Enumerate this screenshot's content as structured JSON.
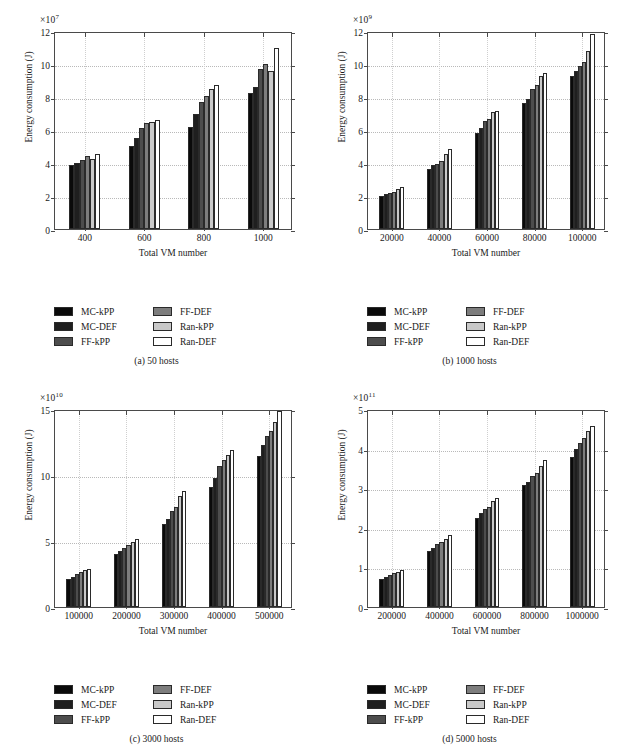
{
  "series_names": [
    "MC-kPP",
    "MC-DEF",
    "FF-kPP",
    "FF-DEF",
    "Ran-kPP",
    "Ran-DEF"
  ],
  "series_colors": [
    "#0a0a0a",
    "#1f1f1f",
    "#4d4d4d",
    "#7d7d7d",
    "#c9c9c9",
    "#ffffff"
  ],
  "legend": {
    "column_left": [
      "MC-kPP",
      "MC-DEF",
      "FF-kPP"
    ],
    "column_right": [
      "FF-DEF",
      "Ran-kPP",
      "Ran-DEF"
    ]
  },
  "panels": [
    {
      "caption": "(a)  50 hosts",
      "caption_tag": "(a)",
      "caption_text": "50 hosts",
      "exp_mantissa": "×10",
      "exp_power": "7",
      "ylabel": "Energy consumption (J)",
      "xlabel": "Total VM number",
      "yticks": [
        "0",
        "2",
        "4",
        "6",
        "8",
        "10",
        "12"
      ],
      "xticks": [
        "400",
        "600",
        "800",
        "1000"
      ],
      "chart_data": {
        "type": "bar",
        "title": "(a) 50 hosts",
        "xlabel": "Total VM number",
        "ylabel": "Energy consumption (J)",
        "y_exponent": 7,
        "ylim": [
          0,
          12
        ],
        "grid": true,
        "legend_position": "below-plot",
        "categories": [
          "400",
          "600",
          "800",
          "1000"
        ],
        "series": [
          {
            "name": "MC-kPP",
            "values": [
              3.87,
              5.02,
              6.18,
              8.24
            ]
          },
          {
            "name": "MC-DEF",
            "values": [
              4.0,
              5.5,
              6.95,
              8.62
            ]
          },
          {
            "name": "FF-kPP",
            "values": [
              4.2,
              6.12,
              7.72,
              9.7
            ]
          },
          {
            "name": "FF-DEF",
            "values": [
              4.45,
              6.4,
              8.05,
              10.03
            ]
          },
          {
            "name": "Ran-kPP",
            "values": [
              4.25,
              6.5,
              8.48,
              9.58
            ]
          },
          {
            "name": "Ran-DEF",
            "values": [
              4.53,
              6.6,
              8.7,
              11.0
            ]
          }
        ]
      }
    },
    {
      "caption": "(b)  1000 hosts",
      "caption_tag": "(b)",
      "caption_text": "1000 hosts",
      "exp_mantissa": "×10",
      "exp_power": "9",
      "ylabel": "Energy consumption (J)",
      "xlabel": "Total VM number",
      "yticks": [
        "0",
        "2",
        "4",
        "6",
        "8",
        "10",
        "12"
      ],
      "xticks": [
        "20000",
        "40000",
        "60000",
        "80000",
        "100000"
      ],
      "chart_data": {
        "type": "bar",
        "title": "(b) 1000 hosts",
        "xlabel": "Total VM number",
        "ylabel": "Energy consumption (J)",
        "y_exponent": 9,
        "ylim": [
          0,
          12
        ],
        "grid": true,
        "legend_position": "below-plot",
        "categories": [
          "20000",
          "40000",
          "60000",
          "80000",
          "100000"
        ],
        "series": [
          {
            "name": "MC-kPP",
            "values": [
              1.98,
              3.65,
              5.83,
              7.65,
              9.28
            ]
          },
          {
            "name": "MC-DEF",
            "values": [
              2.1,
              3.87,
              6.12,
              7.85,
              9.6
            ]
          },
          {
            "name": "FF-kPP",
            "values": [
              2.2,
              3.95,
              6.55,
              8.48,
              9.87
            ]
          },
          {
            "name": "FF-DEF",
            "values": [
              2.25,
              4.13,
              6.68,
              8.75,
              10.13
            ]
          },
          {
            "name": "Ran-kPP",
            "values": [
              2.43,
              4.52,
              7.07,
              9.25,
              10.8
            ]
          },
          {
            "name": "Ran-DEF",
            "values": [
              2.53,
              4.87,
              7.18,
              9.45,
              11.8
            ]
          }
        ]
      }
    },
    {
      "caption": "(c)  3000 hosts",
      "caption_tag": "(c)",
      "caption_text": "3000 hosts",
      "exp_mantissa": "×10",
      "exp_power": "10",
      "ylabel": "Energy consumption (J)",
      "xlabel": "Total VM number",
      "yticks": [
        "0",
        "5",
        "10",
        "15"
      ],
      "xticks": [
        "100000",
        "200000",
        "300000",
        "400000",
        "500000"
      ],
      "chart_data": {
        "type": "bar",
        "title": "(c) 3000 hosts",
        "xlabel": "Total VM number",
        "ylabel": "Energy consumption (J)",
        "y_exponent": 10,
        "ylim": [
          0,
          15
        ],
        "grid": true,
        "legend_position": "below-plot",
        "categories": [
          "100000",
          "200000",
          "300000",
          "400000",
          "500000"
        ],
        "series": [
          {
            "name": "MC-kPP",
            "values": [
              2.15,
              4.05,
              6.3,
              9.1,
              11.45
            ]
          },
          {
            "name": "MC-DEF",
            "values": [
              2.3,
              4.25,
              6.7,
              9.75,
              12.25
            ]
          },
          {
            "name": "FF-kPP",
            "values": [
              2.5,
              4.5,
              7.3,
              10.7,
              12.95
            ]
          },
          {
            "name": "FF-DEF",
            "values": [
              2.62,
              4.72,
              7.6,
              11.15,
              13.3
            ]
          },
          {
            "name": "Ran-kPP",
            "values": [
              2.8,
              4.95,
              8.4,
              11.5,
              13.98
            ]
          },
          {
            "name": "Ran-DEF",
            "values": [
              2.88,
              5.15,
              8.82,
              11.9,
              14.85
            ]
          }
        ]
      }
    },
    {
      "caption": "(d)  5000 hosts",
      "caption_tag": "(d)",
      "caption_text": "5000 hosts",
      "exp_mantissa": "×10",
      "exp_power": "11",
      "ylabel": "Energy consumption (J)",
      "xlabel": "Total VM number",
      "yticks": [
        "0",
        "1",
        "2",
        "3",
        "4",
        "5"
      ],
      "xticks": [
        "200000",
        "400000",
        "600000",
        "800000",
        "1000000"
      ],
      "chart_data": {
        "type": "bar",
        "title": "(d) 5000 hosts",
        "xlabel": "Total VM number",
        "ylabel": "Energy consumption (J)",
        "y_exponent": 11,
        "ylim": [
          0,
          5
        ],
        "grid": true,
        "legend_position": "below-plot",
        "categories": [
          "200000",
          "400000",
          "600000",
          "800000",
          "1000000"
        ],
        "series": [
          {
            "name": "MC-kPP",
            "values": [
              0.72,
              1.42,
              2.24,
              3.07,
              3.8
            ]
          },
          {
            "name": "MC-DEF",
            "values": [
              0.77,
              1.5,
              2.37,
              3.16,
              3.98
            ]
          },
          {
            "name": "FF-kPP",
            "values": [
              0.82,
              1.6,
              2.48,
              3.3,
              4.13
            ]
          },
          {
            "name": "FF-DEF",
            "values": [
              0.85,
              1.64,
              2.52,
              3.39,
              4.28
            ]
          },
          {
            "name": "Ran-kPP",
            "values": [
              0.89,
              1.72,
              2.67,
              3.56,
              4.45
            ]
          },
          {
            "name": "Ran-DEF",
            "values": [
              0.93,
              1.83,
              2.76,
              3.71,
              4.58
            ]
          }
        ]
      }
    }
  ]
}
